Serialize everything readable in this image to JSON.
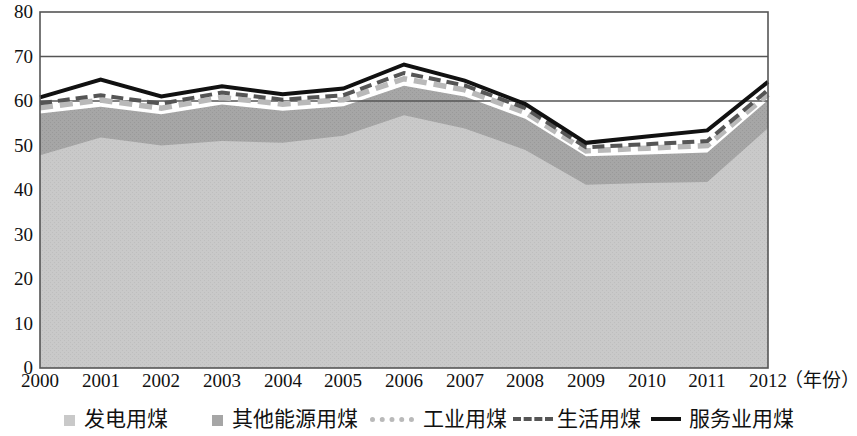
{
  "chart_data": {
    "type": "area",
    "title": "",
    "subtitle": "",
    "xlabel": "（年份）",
    "ylabel": "",
    "categories": [
      "2000",
      "2001",
      "2002",
      "2003",
      "2004",
      "2005",
      "2006",
      "2007",
      "2008",
      "2009",
      "2010",
      "2011",
      "2012"
    ],
    "x": [
      2000,
      2001,
      2002,
      2003,
      2004,
      2005,
      2006,
      2007,
      2008,
      2009,
      2010,
      2011,
      2012
    ],
    "xlim": [
      2000,
      2012
    ],
    "ylim": [
      0,
      80
    ],
    "yticks": [
      0,
      10,
      20,
      30,
      40,
      50,
      60,
      70,
      80
    ],
    "xticks": [
      "2000",
      "2001",
      "2002",
      "2003",
      "2004",
      "2005",
      "2006",
      "2007",
      "2008",
      "2009",
      "2010",
      "2011",
      "2012"
    ],
    "grid": true,
    "grid_lines_y": [
      60,
      70
    ],
    "legend_position": "bottom",
    "stacked": false,
    "series": [
      {
        "name": "发电用煤",
        "render": "area",
        "color": "#c9c9c9",
        "values": [
          47.8,
          51.8,
          50.0,
          51.0,
          50.6,
          52.2,
          56.8,
          53.8,
          49.0,
          41.2,
          41.6,
          41.8,
          53.9
        ]
      },
      {
        "name": "其他能源用煤",
        "render": "area",
        "color": "#a6a6a6",
        "values": [
          57.2,
          58.7,
          57.0,
          59.2,
          57.8,
          58.8,
          63.4,
          61.0,
          56.0,
          47.6,
          48.0,
          48.4,
          60.2
        ]
      },
      {
        "name": "工业用煤",
        "render": "dotted-line",
        "color": "#b9b9b9",
        "values": [
          58.5,
          60.2,
          58.4,
          60.8,
          59.3,
          60.3,
          65.0,
          62.5,
          57.4,
          48.8,
          49.4,
          50.0,
          61.5
        ]
      },
      {
        "name": "生活用煤",
        "render": "dashed-line",
        "color": "#555555",
        "values": [
          59.5,
          61.3,
          59.4,
          61.9,
          60.3,
          61.3,
          66.3,
          63.5,
          58.4,
          49.6,
          50.3,
          51.0,
          62.5
        ]
      },
      {
        "name": "服务业用煤",
        "render": "solid-line",
        "color": "#111111",
        "values": [
          60.8,
          64.8,
          61.0,
          63.3,
          61.5,
          62.8,
          68.2,
          64.6,
          59.3,
          50.6,
          52.0,
          53.4,
          64.3
        ]
      }
    ]
  },
  "axes": {
    "y_ticks": [
      "80",
      "70",
      "60",
      "50",
      "40",
      "30",
      "20",
      "10",
      "0"
    ],
    "x_ticks": [
      "2000",
      "2001",
      "2002",
      "2003",
      "2004",
      "2005",
      "2006",
      "2007",
      "2008",
      "2009",
      "2010",
      "2011",
      "2012"
    ],
    "x_unit_label": "（年份）"
  },
  "legend": {
    "items": [
      {
        "label": "发电用煤",
        "swatch": "square-light-gray",
        "color": "#c9c9c9"
      },
      {
        "label": "其他能源用煤",
        "swatch": "square-dark-gray",
        "color": "#a6a6a6"
      },
      {
        "label": "工业用煤",
        "swatch": "dotted-line-gray",
        "color": "#b9b9b9"
      },
      {
        "label": "生活用煤",
        "swatch": "dashed-line-dark",
        "color": "#555555"
      },
      {
        "label": "服务业用煤",
        "swatch": "solid-line-black",
        "color": "#111111"
      }
    ]
  },
  "style": {
    "plot_border_color": "#555555",
    "gridline_color": "#555555",
    "background": "#ffffff"
  }
}
